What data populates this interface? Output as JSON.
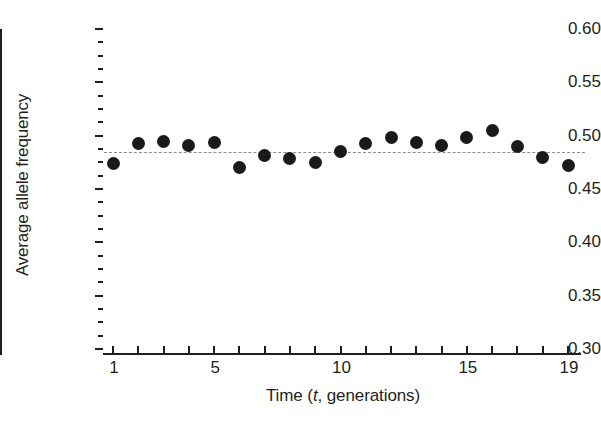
{
  "chart_data": {
    "type": "scatter",
    "title": "",
    "xlabel": "Time (t, generations)",
    "ylabel": "Average allele frequency",
    "x": [
      1,
      2,
      3,
      4,
      5,
      6,
      7,
      8,
      9,
      10,
      11,
      12,
      13,
      14,
      15,
      16,
      17,
      18,
      19
    ],
    "values": [
      0.474,
      0.493,
      0.495,
      0.491,
      0.494,
      0.47,
      0.481,
      0.479,
      0.475,
      0.485,
      0.493,
      0.498,
      0.494,
      0.491,
      0.498,
      0.505,
      0.49,
      0.48,
      0.472
    ],
    "series": [
      {
        "name": "Average allele frequency",
        "marker": "filled-circle",
        "color": "#1a1a1a",
        "values": [
          0.474,
          0.493,
          0.495,
          0.491,
          0.494,
          0.47,
          0.481,
          0.479,
          0.475,
          0.485,
          0.493,
          0.498,
          0.494,
          0.491,
          0.498,
          0.505,
          0.49,
          0.48,
          0.472
        ]
      }
    ],
    "reference_line": {
      "orientation": "horizontal",
      "value": 0.485,
      "style": "dashed",
      "color": "#8d8d8d"
    },
    "xlim": [
      1,
      19
    ],
    "ylim": [
      0.3,
      0.6
    ],
    "ytick_labels": [
      "0.60",
      "0.55",
      "0.50",
      "0.45",
      "0.40",
      "0.35",
      "0.30"
    ],
    "ytick_values": [
      0.6,
      0.55,
      0.5,
      0.45,
      0.4,
      0.35,
      0.3
    ],
    "ytick_minor_step": 0.0125,
    "xtick_values": [
      1,
      2,
      3,
      4,
      5,
      6,
      7,
      8,
      9,
      10,
      11,
      12,
      13,
      14,
      15,
      16,
      17,
      18,
      19
    ],
    "xtick_labeled": [
      {
        "value": 1,
        "label": "1"
      },
      {
        "value": 5,
        "label": "5"
      },
      {
        "value": 10,
        "label": "10"
      },
      {
        "value": 15,
        "label": "15"
      },
      {
        "value": 19,
        "label": "19"
      }
    ],
    "grid": false,
    "legend": null,
    "spines": [
      "left",
      "bottom"
    ],
    "background": "#ffffff"
  },
  "axis_label_parts": {
    "x_prefix": "Time (",
    "x_italic": "t",
    "x_suffix": ", generations)"
  }
}
